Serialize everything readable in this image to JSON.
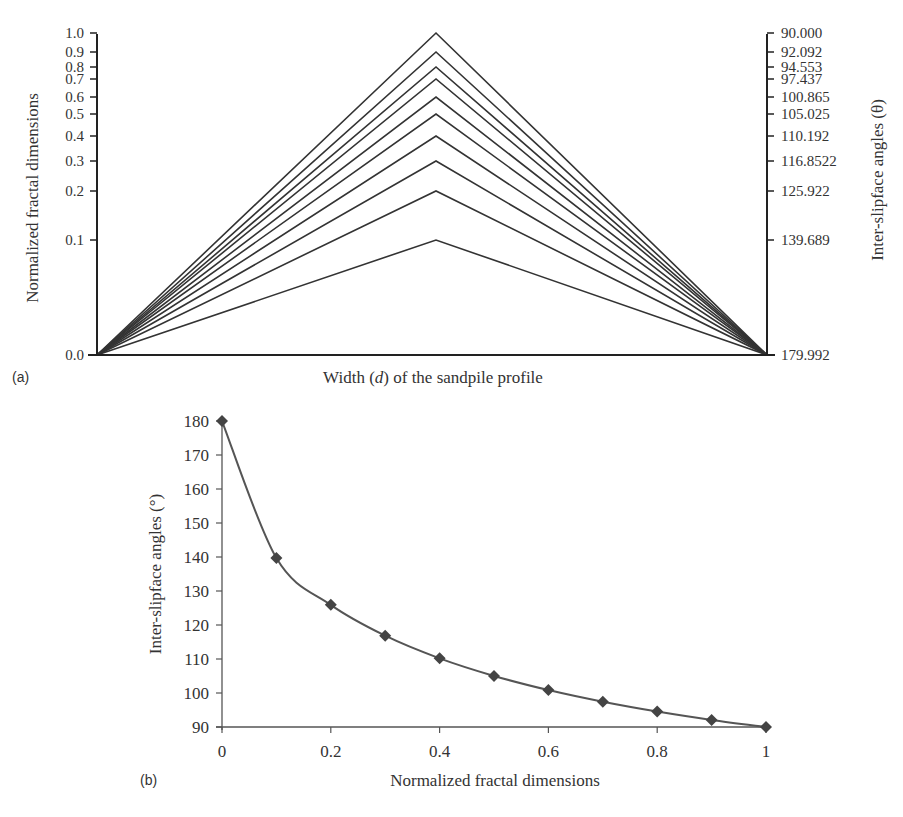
{
  "chart_data": [
    {
      "panel": "(a)",
      "type": "line",
      "title": "",
      "xlabel": "Width (d) of the sandpile profile",
      "xlabel_parts": {
        "before": "Width (",
        "italic": "d",
        "after": ") of the sandpile profile"
      },
      "ylabel_left": "Normalized fractal dimensions",
      "ylabel_right": "Inter-slipface angles (θ)",
      "left_ticks": [
        "0.0",
        "0.1",
        "0.2",
        "0.3",
        "0.4",
        "0.5",
        "0.6",
        "0.7",
        "0.8",
        "0.9",
        "1.0"
      ],
      "right_ticks": [
        "179.992",
        "139.689",
        "125.922",
        "116.8522",
        "110.192",
        "105.025",
        "100.865",
        "97.437",
        "94.553",
        "92.092",
        "90.000"
      ],
      "description": "Triangular sandpile profiles: each line rises from the left corner to a peak at mid-width and falls to the right corner; peak height equals normalized fractal dimension (0.1–1.0) mapped to inter-slipface angle.",
      "series": [
        {
          "name": "D=0.1",
          "peak": 0.1,
          "angle": 139.689
        },
        {
          "name": "D=0.2",
          "peak": 0.2,
          "angle": 125.922
        },
        {
          "name": "D=0.3",
          "peak": 0.3,
          "angle": 116.8522
        },
        {
          "name": "D=0.4",
          "peak": 0.4,
          "angle": 110.192
        },
        {
          "name": "D=0.5",
          "peak": 0.5,
          "angle": 105.025
        },
        {
          "name": "D=0.6",
          "peak": 0.6,
          "angle": 100.865
        },
        {
          "name": "D=0.7",
          "peak": 0.7,
          "angle": 97.437
        },
        {
          "name": "D=0.8",
          "peak": 0.8,
          "angle": 94.553
        },
        {
          "name": "D=0.9",
          "peak": 0.9,
          "angle": 92.092
        },
        {
          "name": "D=1.0",
          "peak": 1.0,
          "angle": 90.0
        }
      ],
      "grid": false,
      "legend": "none"
    },
    {
      "panel": "(b)",
      "type": "line",
      "title": "",
      "xlabel": "Normalized fractal dimensions",
      "ylabel": "Inter-slipface angles (°)",
      "x": [
        0,
        0.1,
        0.2,
        0.3,
        0.4,
        0.5,
        0.6,
        0.7,
        0.8,
        0.9,
        1.0
      ],
      "series": [
        {
          "name": "Inter-slipface angle",
          "marker": "diamond",
          "values": [
            179.992,
            139.689,
            125.922,
            116.8522,
            110.192,
            105.025,
            100.865,
            97.437,
            94.553,
            92.092,
            90.0
          ]
        }
      ],
      "xticks": [
        "0",
        "0.2",
        "0.4",
        "0.6",
        "0.8",
        "1"
      ],
      "yticks": [
        "90",
        "100",
        "110",
        "120",
        "130",
        "140",
        "150",
        "160",
        "170",
        "180"
      ],
      "xlim": [
        0,
        1
      ],
      "ylim": [
        90,
        180
      ],
      "grid": false,
      "legend": "none"
    }
  ],
  "colors": {
    "line": "#333333",
    "marker": "#444444",
    "axis": "#222222"
  }
}
